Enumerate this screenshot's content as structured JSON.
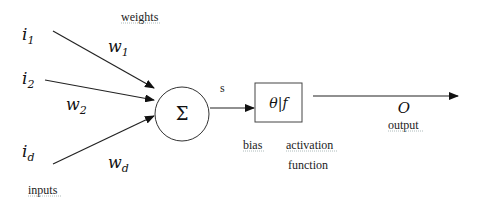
{
  "diagram": {
    "type": "perceptron-neuron",
    "inputs": [
      {
        "name": "i",
        "sub": "1"
      },
      {
        "name": "i",
        "sub": "2"
      },
      {
        "name": "i",
        "sub": "d"
      }
    ],
    "weights": [
      {
        "name": "w",
        "sub": "1"
      },
      {
        "name": "w",
        "sub": "2"
      },
      {
        "name": "w",
        "sub": "d"
      }
    ],
    "labels": {
      "weights": "weights",
      "inputs": "inputs",
      "sum_symbol": "Σ",
      "sum_output": "s",
      "box_theta": "θ",
      "box_sep": "|",
      "box_f": "f",
      "bias": "bias",
      "activation": "activation",
      "function": "function",
      "output_symbol": "O",
      "output": "output"
    },
    "colors": {
      "stroke": "#222222",
      "background": "#ffffff"
    }
  }
}
